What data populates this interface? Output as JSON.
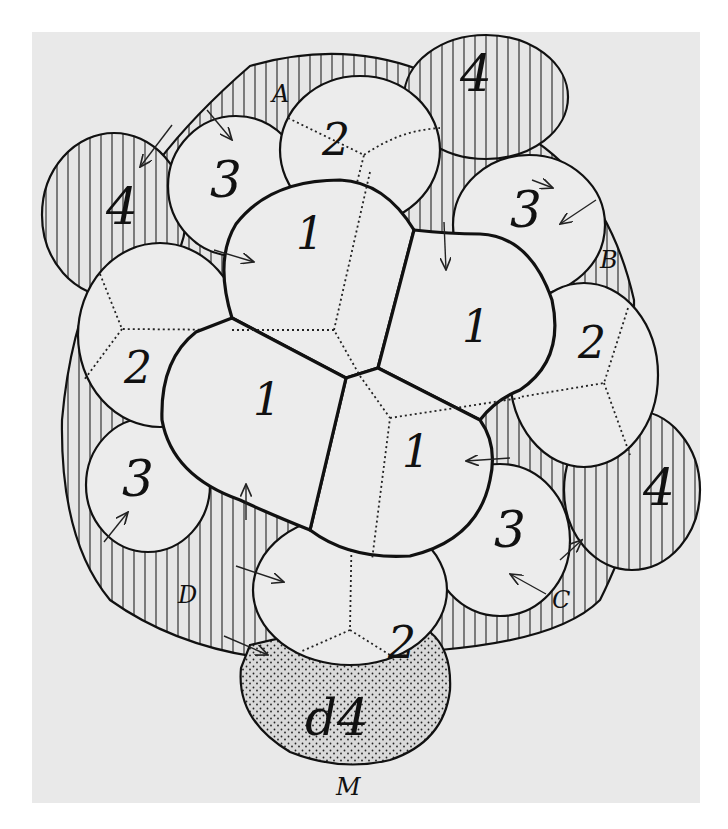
{
  "figure": {
    "type": "embryo-cleavage-diagram",
    "colors": {
      "background": "#ffffff",
      "panel": "#e9e9e9",
      "cell_fill": "#ececec",
      "line": "#111111"
    },
    "labels": {
      "first_quartet": [
        "1",
        "1",
        "1",
        "1"
      ],
      "second_quartet": [
        "2",
        "2",
        "2",
        "2"
      ],
      "third_quartet": [
        "3",
        "3",
        "3",
        "3"
      ],
      "fourth_quartet": [
        "4",
        "4",
        "4"
      ],
      "mesentoblast": "d4",
      "mesentoblast_marker": "M",
      "quadrants": [
        "A",
        "B",
        "C",
        "D"
      ]
    }
  }
}
